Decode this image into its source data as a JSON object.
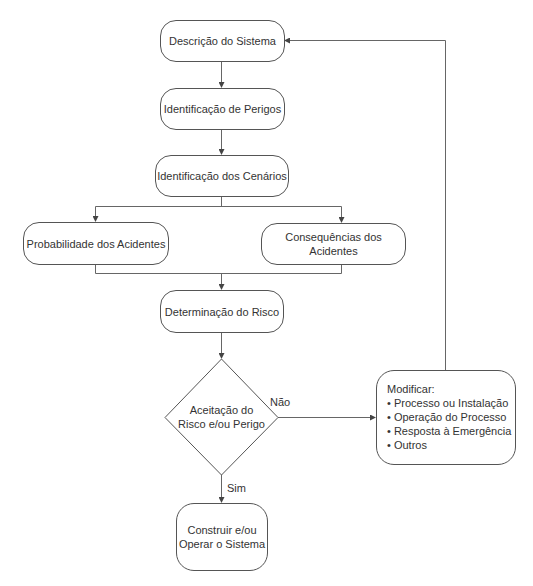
{
  "diagram": {
    "title": "",
    "nodes": {
      "system_description": "Descrição do Sistema",
      "hazard_identification": "Identificação de Perigos",
      "scenario_identification": "Identificação dos Cenários",
      "accident_probability": "Probabilidade dos Acidentes",
      "accident_consequences": "Consequências dos Acidentes",
      "risk_determination": "Determinação do Risco",
      "decision": "Aceitação do\nRisco e/ou Perigo",
      "build_operate": "Construir e/ou\nOperar o Sistema",
      "modify": {
        "heading": "Modificar:",
        "items": [
          "• Processo ou Instalação",
          "• Operação do Processo",
          "• Resposta à Emergência",
          "• Outros"
        ]
      }
    },
    "edge_labels": {
      "no": "Não",
      "yes": "Sim"
    },
    "colors": {
      "line": "#555555",
      "text": "#333333",
      "background": "#ffffff"
    }
  }
}
